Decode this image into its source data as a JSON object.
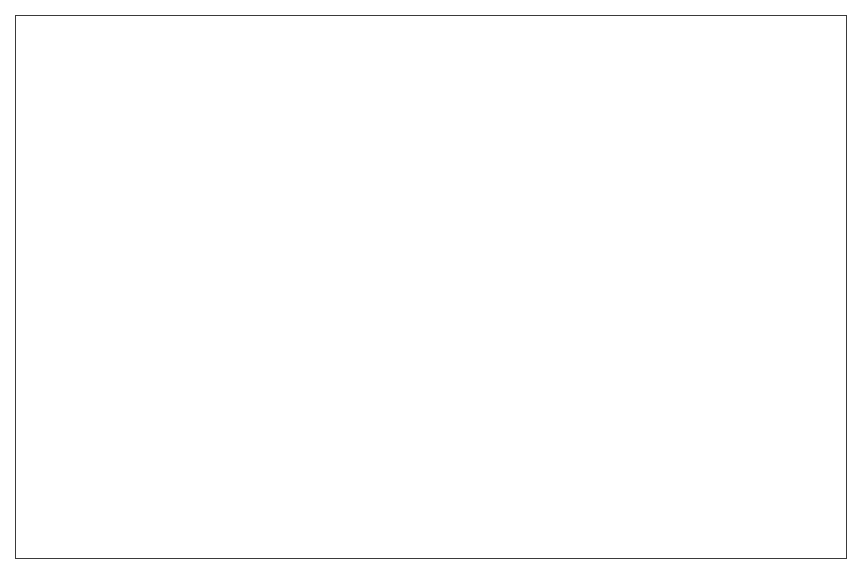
{
  "figure": {
    "background_color": "#ffffff",
    "frame_color": "#3a3a3a",
    "marker_color": "#1d1d1d",
    "axis_color": "#222222"
  },
  "chart_data": {
    "type": "scatter",
    "title": "",
    "subtitle": "",
    "xlabel": "Inpatient & Residential Treatment Beds/ 100,000 State Residents",
    "ylabel": "Adults in Corrections/100,000",
    "xlim": [
      0,
      40000
    ],
    "ylim": [
      0,
      10000
    ],
    "grid": false,
    "legend": null,
    "xticks": [
      0,
      10000,
      20000,
      30000,
      40000
    ],
    "xtick_labels": [
      "0",
      "10,000",
      "20,000",
      "30,000",
      "40,000"
    ],
    "yticks": [
      0,
      2000,
      4000,
      6000,
      8000,
      10000
    ],
    "ytick_labels": [
      "0",
      "2,000",
      "4,000",
      "6,000",
      "8,000",
      "10,000"
    ],
    "marker_style": "open-circle",
    "marker_size_px": 13,
    "series": [
      {
        "name": "States",
        "points": [
          [
            400,
            3020
          ],
          [
            2500,
            5580
          ],
          [
            7700,
            3700
          ],
          [
            14800,
            3790
          ],
          [
            16400,
            2300
          ],
          [
            22700,
            2570
          ],
          [
            34000,
            2100
          ],
          [
            10200,
            2700
          ],
          [
            11400,
            2690
          ],
          [
            11900,
            2700
          ],
          [
            10100,
            1900
          ],
          [
            10600,
            1820
          ],
          [
            8500,
            2200
          ],
          [
            7200,
            1420
          ],
          [
            6600,
            1680
          ],
          [
            6100,
            2320
          ],
          [
            5700,
            2270
          ],
          [
            5200,
            2350
          ],
          [
            5000,
            2180
          ],
          [
            4700,
            2130
          ],
          [
            4500,
            2420
          ],
          [
            4300,
            2050
          ],
          [
            4100,
            1820
          ],
          [
            3950,
            2620
          ],
          [
            3800,
            2200
          ],
          [
            3600,
            1950
          ],
          [
            3450,
            2460
          ],
          [
            3300,
            2090
          ],
          [
            3150,
            1770
          ],
          [
            3000,
            2740
          ],
          [
            2900,
            2220
          ],
          [
            2800,
            1980
          ],
          [
            2700,
            1640
          ],
          [
            2600,
            2340
          ],
          [
            2500,
            2110
          ],
          [
            2400,
            1880
          ],
          [
            2300,
            1520
          ],
          [
            2200,
            2280
          ],
          [
            2100,
            2020
          ],
          [
            2000,
            1780
          ],
          [
            1950,
            1430
          ],
          [
            1900,
            2420
          ],
          [
            1850,
            2160
          ],
          [
            1800,
            1900
          ],
          [
            1750,
            1650
          ],
          [
            1700,
            1350
          ],
          [
            1650,
            2250
          ],
          [
            1600,
            2000
          ],
          [
            1550,
            1760
          ],
          [
            1500,
            1500
          ],
          [
            1450,
            1220
          ],
          [
            1400,
            2180
          ],
          [
            1350,
            1930
          ],
          [
            1300,
            1680
          ],
          [
            1250,
            1420
          ],
          [
            1200,
            1150
          ],
          [
            1150,
            2080
          ],
          [
            1100,
            1850
          ],
          [
            1050,
            1600
          ],
          [
            1000,
            1340
          ],
          [
            950,
            1080
          ],
          [
            900,
            1990
          ],
          [
            850,
            1740
          ],
          [
            800,
            1490
          ],
          [
            750,
            1250
          ],
          [
            700,
            1010
          ],
          [
            650,
            1900
          ],
          [
            600,
            1660
          ],
          [
            550,
            1400
          ],
          [
            500,
            1160
          ],
          [
            450,
            2130
          ],
          [
            420,
            1560
          ],
          [
            380,
            1300
          ],
          [
            350,
            960
          ],
          [
            320,
            2020
          ],
          [
            300,
            1450
          ],
          [
            2150,
            1180
          ],
          [
            2350,
            1300
          ],
          [
            3700,
            1500
          ],
          [
            4850,
            1550
          ],
          [
            5500,
            1300
          ],
          [
            6900,
            2300
          ],
          [
            8100,
            1450
          ],
          [
            2750,
            1150
          ],
          [
            3100,
            1350
          ],
          [
            4400,
            1280
          ],
          [
            1500,
            2600
          ],
          [
            2050,
            2560
          ]
        ]
      }
    ],
    "trend_line": {
      "name": "linear fit",
      "x_start": 0,
      "y_start": 1980,
      "x_end": 43500,
      "y_end": 3050
    }
  }
}
